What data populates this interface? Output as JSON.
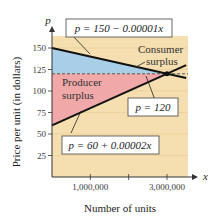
{
  "chart_data": {
    "type": "line",
    "title": "",
    "xlabel": "Number of units",
    "ylabel": "Price per unit (in dollars)",
    "x_axis_letter": "x",
    "y_axis_letter": "p",
    "xlim": [
      0,
      3500000
    ],
    "ylim": [
      0,
      160
    ],
    "x_ticks": [
      1000000,
      2000000,
      3000000
    ],
    "x_tick_labels": [
      "1,000,000",
      "",
      "3,000,000"
    ],
    "y_ticks": [
      25,
      50,
      75,
      100,
      125,
      150
    ],
    "y_tick_labels": [
      "25",
      "50",
      "75",
      "100",
      "125",
      "150"
    ],
    "grid": true,
    "series": [
      {
        "name": "Demand",
        "equation": "p = 150 - 0.00001x",
        "intercept": 150,
        "slope": -1e-05,
        "color": "#111111"
      },
      {
        "name": "Supply",
        "equation": "p = 60 + 0.00002x",
        "intercept": 60,
        "slope": 2e-05,
        "color": "#111111"
      },
      {
        "name": "Equilibrium price",
        "equation": "p = 120",
        "value": 120,
        "style": "dashed",
        "color": "#555555"
      }
    ],
    "equilibrium_point": {
      "x": 3000000,
      "p": 120
    },
    "regions": [
      {
        "name": "Consumer surplus",
        "label_line1": "Consumer",
        "label_line2": "surplus",
        "color": "#a9cfe8"
      },
      {
        "name": "Producer surplus",
        "label_line1": "Producer",
        "label_line2": "surplus",
        "color": "#f0a8a8"
      }
    ],
    "background_color": "#f5deb0",
    "annotations": [
      "p = 150 − 0.00001x",
      "p = 120",
      "p = 60 + 0.00002x"
    ]
  }
}
